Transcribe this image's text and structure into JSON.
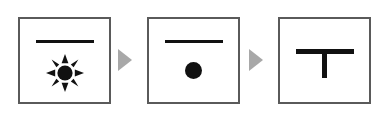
{
  "figure": {
    "name": "three-panel-icon-sequence",
    "background_color": "#ffffff",
    "panel_border_color": "#5a5a5a",
    "shape_color": "#111111",
    "arrow_color": "#a8a8a8",
    "panel_count": 3,
    "arrow_count": 2
  },
  "panels": [
    {
      "index": 1,
      "label": "",
      "elements": [
        {
          "icon": "horizontal-bar-icon",
          "description": "horizontal bar"
        },
        {
          "icon": "sun-icon",
          "description": "filled circle with eight triangular rays"
        }
      ]
    },
    {
      "index": 2,
      "label": "",
      "elements": [
        {
          "icon": "horizontal-bar-icon",
          "description": "horizontal bar"
        },
        {
          "icon": "filled-circle-icon",
          "description": "plain filled circle, no rays"
        }
      ]
    },
    {
      "index": 3,
      "label": "",
      "elements": [
        {
          "icon": "t-shape-icon",
          "description": "horizontal bar with vertical stem forming a T"
        }
      ]
    }
  ],
  "arrows": [
    {
      "index": 1,
      "icon": "triangle-right-icon",
      "label": ""
    },
    {
      "index": 2,
      "icon": "triangle-right-icon",
      "label": ""
    }
  ]
}
